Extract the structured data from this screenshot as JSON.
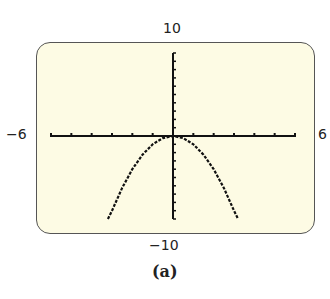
{
  "labels": {
    "ymax": "10",
    "ymin": "−10",
    "xmin": "−6",
    "xmax": "6",
    "caption": "(a)"
  },
  "chart_data": {
    "type": "line",
    "title": "",
    "caption": "(a)",
    "function": "y = -x^2",
    "xlim": [
      -6,
      6
    ],
    "ylim": [
      -10,
      10
    ],
    "xscale": 1,
    "yscale": 1,
    "grid": false,
    "series": [
      {
        "name": "y = -x^2",
        "x": [
          -3.2,
          -3,
          -2.5,
          -2,
          -1.5,
          -1,
          -0.5,
          0,
          0.5,
          1,
          1.5,
          2,
          2.5,
          3,
          3.2
        ],
        "y": [
          -10.24,
          -9,
          -6.25,
          -4,
          -2.25,
          -1,
          -0.25,
          0,
          -0.25,
          -1,
          -2.25,
          -4,
          -6.25,
          -9,
          -10.24
        ]
      }
    ],
    "style": {
      "background": "#fdfbe4",
      "line": "#111111"
    }
  }
}
